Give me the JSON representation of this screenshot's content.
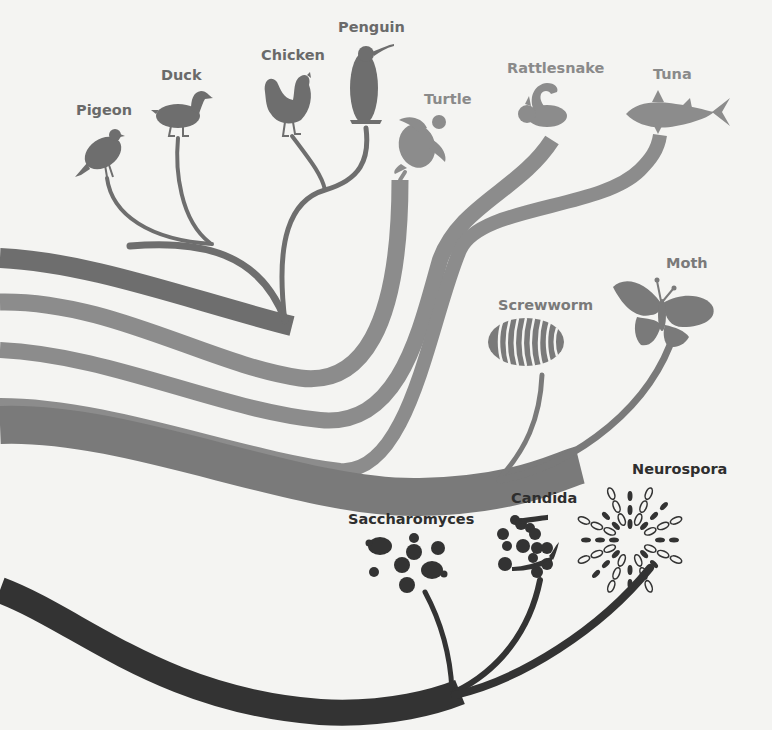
{
  "diagram": {
    "type": "phylogenetic-tree",
    "colors": {
      "background": "#f4f4f2",
      "birds": "#6e6e6e",
      "reptiles_fish": "#8c8c8c",
      "insects": "#7a7a7a",
      "fungi": "#333333"
    },
    "lineages": [
      {
        "id": "birds",
        "color": "#6e6e6e",
        "taxa": [
          {
            "name": "Pigeon",
            "icon": "pigeon-icon"
          },
          {
            "name": "Duck",
            "icon": "duck-icon"
          },
          {
            "name": "Chicken",
            "icon": "chicken-icon"
          },
          {
            "name": "Penguin",
            "icon": "penguin-icon"
          }
        ]
      },
      {
        "id": "turtle",
        "color": "#8c8c8c",
        "taxa": [
          {
            "name": "Turtle",
            "icon": "turtle-icon"
          }
        ]
      },
      {
        "id": "rattlesnake",
        "color": "#8c8c8c",
        "taxa": [
          {
            "name": "Rattlesnake",
            "icon": "rattlesnake-icon"
          }
        ]
      },
      {
        "id": "tuna",
        "color": "#8c8c8c",
        "taxa": [
          {
            "name": "Tuna",
            "icon": "tuna-icon"
          }
        ]
      },
      {
        "id": "insects",
        "color": "#7a7a7a",
        "taxa": [
          {
            "name": "Screwworm",
            "icon": "screwworm-icon"
          },
          {
            "name": "Moth",
            "icon": "moth-icon"
          }
        ]
      },
      {
        "id": "fungi",
        "color": "#333333",
        "taxa": [
          {
            "name": "Saccharomyces",
            "icon": "saccharomyces-icon"
          },
          {
            "name": "Candida",
            "icon": "candida-icon"
          },
          {
            "name": "Neurospora",
            "icon": "neurospora-icon"
          }
        ]
      }
    ]
  }
}
